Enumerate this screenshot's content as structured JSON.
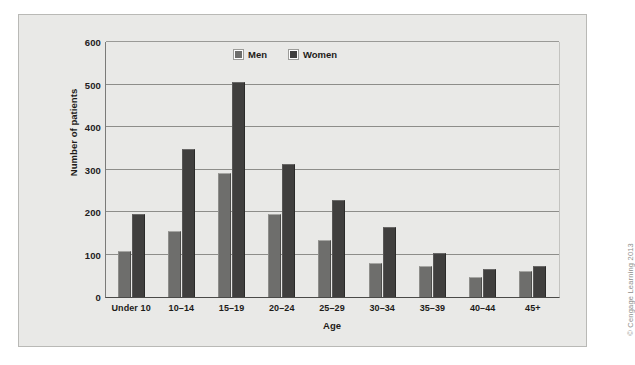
{
  "chart_data": {
    "type": "bar",
    "title": "",
    "xlabel": "Age",
    "ylabel": "Number of patients",
    "ylim": [
      0,
      600
    ],
    "yticks": [
      0,
      100,
      200,
      300,
      400,
      500,
      600
    ],
    "ytick_labels": [
      "0",
      "100",
      "200",
      "300",
      "400",
      "500",
      "600"
    ],
    "grid": true,
    "legend_position": "top-center",
    "categories": [
      "Under 10",
      "10–14",
      "15–19",
      "20–24",
      "25–29",
      "30–34",
      "35–39",
      "40–44",
      "45+"
    ],
    "series": [
      {
        "name": "Men",
        "color": "#6e6e6c",
        "values": [
          108,
          155,
          292,
          195,
          135,
          80,
          73,
          47,
          62
        ]
      },
      {
        "name": "Women",
        "color": "#403f3e",
        "values": [
          195,
          348,
          505,
          313,
          228,
          165,
          103,
          65,
          73
        ]
      }
    ]
  },
  "legend": {
    "items": [
      {
        "label": "Men",
        "swatch": "men-swatch"
      },
      {
        "label": "Women",
        "swatch": "women-swatch"
      }
    ]
  },
  "credit": {
    "text": "© Cengage Learning 2013"
  },
  "colors": {
    "panel_background": "#e9e9e7",
    "panel_border": "#b9b9b6",
    "gridline": "#8d8d8a",
    "men": "#6e6e6c",
    "women": "#403f3e",
    "text": "#1d1b19"
  }
}
